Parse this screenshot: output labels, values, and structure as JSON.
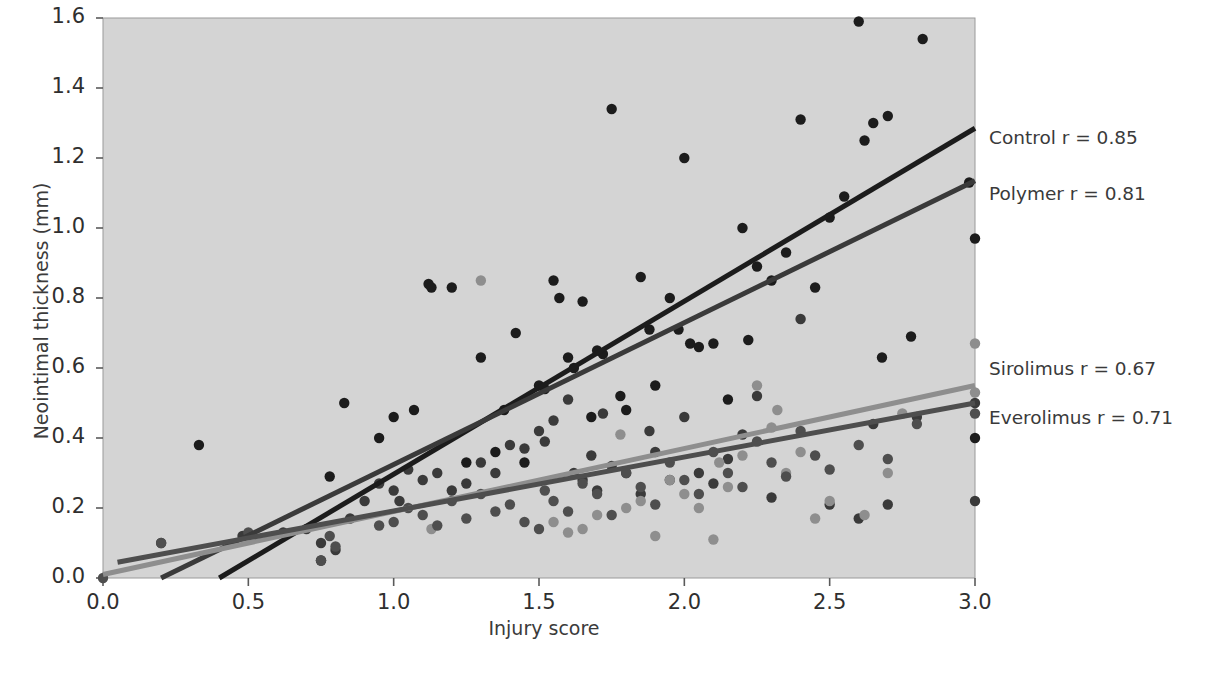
{
  "chart_data": {
    "type": "scatter",
    "title": "",
    "xlabel": "Injury score",
    "ylabel": "Neointimal thickness (mm)",
    "xlim": [
      0.0,
      3.0
    ],
    "ylim": [
      0.0,
      1.6
    ],
    "xticks": [
      "0.0",
      "0.5",
      "1.0",
      "1.5",
      "2.0",
      "2.5",
      "3.0"
    ],
    "yticks": [
      "0.0",
      "0.2",
      "0.4",
      "0.6",
      "0.8",
      "1.0",
      "1.2",
      "1.4",
      "1.6"
    ],
    "xtick_values": [
      0.0,
      0.5,
      1.0,
      1.5,
      2.0,
      2.5,
      3.0
    ],
    "ytick_values": [
      0.0,
      0.2,
      0.4,
      0.6,
      0.8,
      1.0,
      1.2,
      1.4,
      1.6
    ],
    "grid": false,
    "legend_position": "right-inline-annotations",
    "plot_background": "#d4d4d4",
    "figure_background": "#ffffff",
    "marker_radius": 5.2,
    "series": [
      {
        "name": "Control",
        "label": "Control r = 0.85",
        "r": 0.85,
        "color": "#1c1c1c",
        "line": {
          "x0": 0.4,
          "y0": 0.0,
          "x1": 3.0,
          "y1": 1.285,
          "width": 5
        },
        "label_xy": [
          3.05,
          1.255
        ],
        "points": [
          [
            0.33,
            0.38
          ],
          [
            0.75,
            0.05
          ],
          [
            0.78,
            0.29
          ],
          [
            0.83,
            0.5
          ],
          [
            0.95,
            0.4
          ],
          [
            1.0,
            0.46
          ],
          [
            1.07,
            0.48
          ],
          [
            1.12,
            0.84
          ],
          [
            1.13,
            0.83
          ],
          [
            1.2,
            0.83
          ],
          [
            1.25,
            0.33
          ],
          [
            1.3,
            0.63
          ],
          [
            1.35,
            0.36
          ],
          [
            1.38,
            0.48
          ],
          [
            1.42,
            0.7
          ],
          [
            1.45,
            0.33
          ],
          [
            1.5,
            0.55
          ],
          [
            1.52,
            0.54
          ],
          [
            1.55,
            0.85
          ],
          [
            1.57,
            0.8
          ],
          [
            1.6,
            0.63
          ],
          [
            1.62,
            0.6
          ],
          [
            1.65,
            0.79
          ],
          [
            1.68,
            0.46
          ],
          [
            1.7,
            0.65
          ],
          [
            1.72,
            0.64
          ],
          [
            1.75,
            1.34
          ],
          [
            1.78,
            0.52
          ],
          [
            1.8,
            0.48
          ],
          [
            1.85,
            0.86
          ],
          [
            1.88,
            0.71
          ],
          [
            1.9,
            0.55
          ],
          [
            1.95,
            0.8
          ],
          [
            1.98,
            0.71
          ],
          [
            2.0,
            1.2
          ],
          [
            2.02,
            0.67
          ],
          [
            2.05,
            0.66
          ],
          [
            2.1,
            0.67
          ],
          [
            2.15,
            0.51
          ],
          [
            2.2,
            1.0
          ],
          [
            2.22,
            0.68
          ],
          [
            2.25,
            0.89
          ],
          [
            2.3,
            0.85
          ],
          [
            2.35,
            0.93
          ],
          [
            2.4,
            1.31
          ],
          [
            2.45,
            0.83
          ],
          [
            2.5,
            1.03
          ],
          [
            2.55,
            1.09
          ],
          [
            2.6,
            1.59
          ],
          [
            2.62,
            1.25
          ],
          [
            2.65,
            1.3
          ],
          [
            2.68,
            0.63
          ],
          [
            2.7,
            1.32
          ],
          [
            2.78,
            0.69
          ],
          [
            2.82,
            1.54
          ],
          [
            2.98,
            1.13
          ],
          [
            3.0,
            0.97
          ],
          [
            3.0,
            0.4
          ]
        ]
      },
      {
        "name": "Polymer",
        "label": "Polymer r = 0.81",
        "r": 0.81,
        "color": "#3a3a3a",
        "line": {
          "x0": 0.2,
          "y0": 0.0,
          "x1": 3.0,
          "y1": 1.135,
          "width": 5
        },
        "label_xy": [
          3.05,
          1.095
        ],
        "points": [
          [
            0.2,
            0.1
          ],
          [
            0.48,
            0.12
          ],
          [
            0.62,
            0.13
          ],
          [
            0.7,
            0.14
          ],
          [
            0.75,
            0.1
          ],
          [
            0.8,
            0.08
          ],
          [
            0.85,
            0.17
          ],
          [
            0.9,
            0.22
          ],
          [
            0.95,
            0.27
          ],
          [
            1.0,
            0.25
          ],
          [
            1.02,
            0.22
          ],
          [
            1.05,
            0.31
          ],
          [
            1.1,
            0.28
          ],
          [
            1.15,
            0.3
          ],
          [
            1.2,
            0.25
          ],
          [
            1.25,
            0.27
          ],
          [
            1.3,
            0.33
          ],
          [
            1.35,
            0.3
          ],
          [
            1.4,
            0.38
          ],
          [
            1.45,
            0.37
          ],
          [
            1.5,
            0.42
          ],
          [
            1.52,
            0.39
          ],
          [
            1.55,
            0.45
          ],
          [
            1.6,
            0.51
          ],
          [
            1.62,
            0.3
          ],
          [
            1.65,
            0.28
          ],
          [
            1.68,
            0.35
          ],
          [
            1.7,
            0.25
          ],
          [
            1.72,
            0.47
          ],
          [
            1.75,
            0.32
          ],
          [
            1.8,
            0.3
          ],
          [
            1.85,
            0.24
          ],
          [
            1.88,
            0.42
          ],
          [
            1.9,
            0.36
          ],
          [
            1.95,
            0.28
          ],
          [
            2.0,
            0.46
          ],
          [
            2.05,
            0.3
          ],
          [
            2.1,
            0.27
          ],
          [
            2.15,
            0.34
          ],
          [
            2.2,
            0.41
          ],
          [
            2.25,
            0.52
          ],
          [
            2.3,
            0.23
          ],
          [
            2.4,
            0.74
          ],
          [
            2.5,
            0.21
          ],
          [
            2.6,
            0.17
          ],
          [
            2.65,
            0.44
          ],
          [
            2.7,
            0.21
          ],
          [
            2.8,
            0.46
          ],
          [
            3.0,
            0.5
          ],
          [
            3.0,
            0.22
          ]
        ]
      },
      {
        "name": "Sirolimus",
        "label": "Sirolimus r = 0.67",
        "r": 0.67,
        "color": "#8e8e8e",
        "line": {
          "x0": 0.0,
          "y0": 0.01,
          "x1": 3.0,
          "y1": 0.55,
          "width": 5
        },
        "label_xy": [
          3.05,
          0.595
        ],
        "points": [
          [
            1.13,
            0.14
          ],
          [
            1.3,
            0.85
          ],
          [
            1.55,
            0.16
          ],
          [
            1.6,
            0.13
          ],
          [
            1.65,
            0.14
          ],
          [
            1.7,
            0.18
          ],
          [
            1.78,
            0.41
          ],
          [
            1.8,
            0.2
          ],
          [
            1.85,
            0.22
          ],
          [
            1.9,
            0.12
          ],
          [
            1.95,
            0.28
          ],
          [
            2.0,
            0.24
          ],
          [
            2.05,
            0.2
          ],
          [
            2.1,
            0.11
          ],
          [
            2.12,
            0.33
          ],
          [
            2.15,
            0.26
          ],
          [
            2.2,
            0.35
          ],
          [
            2.25,
            0.55
          ],
          [
            2.3,
            0.43
          ],
          [
            2.32,
            0.48
          ],
          [
            2.35,
            0.3
          ],
          [
            2.4,
            0.36
          ],
          [
            2.45,
            0.17
          ],
          [
            2.5,
            0.22
          ],
          [
            2.62,
            0.18
          ],
          [
            2.7,
            0.3
          ],
          [
            2.75,
            0.47
          ],
          [
            3.0,
            0.67
          ],
          [
            3.0,
            0.53
          ]
        ]
      },
      {
        "name": "Everolimus",
        "label": "Everolimus r = 0.71",
        "r": 0.71,
        "color": "#4e4e4e",
        "line": {
          "x0": 0.05,
          "y0": 0.045,
          "x1": 3.0,
          "y1": 0.5,
          "width": 5
        },
        "label_xy": [
          3.05,
          0.455
        ],
        "points": [
          [
            0.0,
            0.0
          ],
          [
            0.2,
            0.1
          ],
          [
            0.5,
            0.13
          ],
          [
            0.75,
            0.05
          ],
          [
            0.78,
            0.12
          ],
          [
            0.8,
            0.09
          ],
          [
            0.95,
            0.15
          ],
          [
            1.0,
            0.16
          ],
          [
            1.05,
            0.2
          ],
          [
            1.1,
            0.18
          ],
          [
            1.15,
            0.15
          ],
          [
            1.2,
            0.22
          ],
          [
            1.25,
            0.17
          ],
          [
            1.3,
            0.24
          ],
          [
            1.35,
            0.19
          ],
          [
            1.4,
            0.21
          ],
          [
            1.45,
            0.16
          ],
          [
            1.5,
            0.14
          ],
          [
            1.52,
            0.25
          ],
          [
            1.55,
            0.22
          ],
          [
            1.6,
            0.19
          ],
          [
            1.65,
            0.27
          ],
          [
            1.7,
            0.24
          ],
          [
            1.75,
            0.18
          ],
          [
            1.8,
            0.3
          ],
          [
            1.85,
            0.26
          ],
          [
            1.9,
            0.21
          ],
          [
            1.95,
            0.33
          ],
          [
            2.0,
            0.28
          ],
          [
            2.05,
            0.24
          ],
          [
            2.1,
            0.36
          ],
          [
            2.15,
            0.3
          ],
          [
            2.2,
            0.26
          ],
          [
            2.25,
            0.39
          ],
          [
            2.3,
            0.33
          ],
          [
            2.35,
            0.29
          ],
          [
            2.4,
            0.42
          ],
          [
            2.45,
            0.35
          ],
          [
            2.5,
            0.31
          ],
          [
            2.6,
            0.38
          ],
          [
            2.7,
            0.34
          ],
          [
            2.8,
            0.44
          ],
          [
            3.0,
            0.47
          ]
        ]
      }
    ]
  }
}
